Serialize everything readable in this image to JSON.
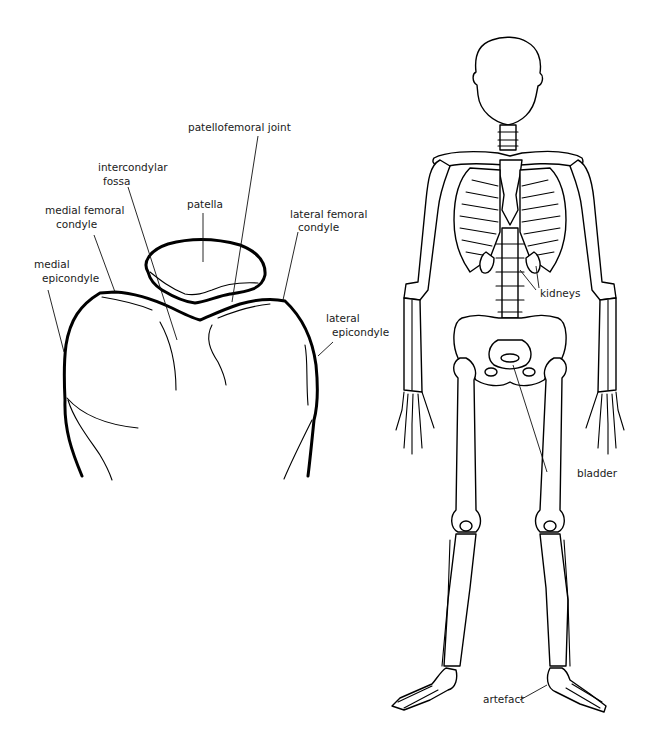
{
  "figure": {
    "left_panel": {
      "title": "Knee joint (femoral condyles and patella), axial view",
      "labels": [
        {
          "id": "patellofemoral-joint",
          "lines": [
            "patellofemoral joint"
          ]
        },
        {
          "id": "intercondylar-fossa",
          "lines": [
            "intercondylar",
            "fossa"
          ]
        },
        {
          "id": "patella",
          "lines": [
            "patella"
          ]
        },
        {
          "id": "medial-femoral-condyle",
          "lines": [
            "medial femoral",
            "condyle"
          ]
        },
        {
          "id": "lateral-femoral-condyle",
          "lines": [
            "lateral femoral",
            "condyle"
          ]
        },
        {
          "id": "medial-epicondyle",
          "lines": [
            "medial",
            "epicondyle"
          ]
        },
        {
          "id": "lateral-epicondyle",
          "lines": [
            "lateral",
            "epicondyle"
          ]
        }
      ]
    },
    "right_panel": {
      "title": "Full skeleton, anterior view",
      "labels": [
        {
          "id": "kidneys",
          "lines": [
            "kidneys"
          ]
        },
        {
          "id": "bladder",
          "lines": [
            "bladder"
          ]
        },
        {
          "id": "artefact",
          "lines": [
            "artefact"
          ]
        }
      ]
    }
  }
}
